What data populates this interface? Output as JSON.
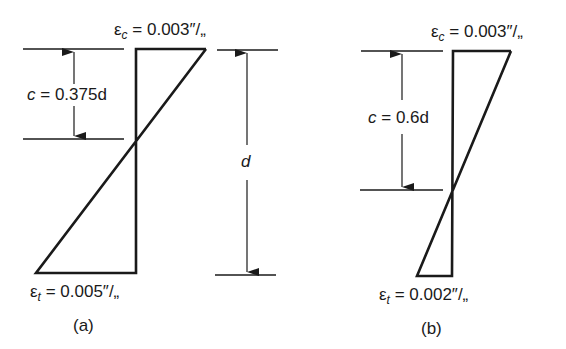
{
  "diagrams": [
    {
      "id": "a",
      "caption": "(a)",
      "top_strain": {
        "symbol": "ε",
        "sub": "c",
        "value": "= 0.003″/„"
      },
      "bottom_strain": {
        "symbol": "ε",
        "sub": "t",
        "value": "= 0.005″/„"
      },
      "neutral_axis": {
        "var": "c",
        "value": "= 0.375d"
      },
      "depth_label": "d"
    },
    {
      "id": "b",
      "caption": "(b)",
      "top_strain": {
        "symbol": "ε",
        "sub": "c",
        "value": "= 0.003″/„"
      },
      "bottom_strain": {
        "symbol": "ε",
        "sub": "t",
        "value": "= 0.002″/„"
      },
      "neutral_axis": {
        "var": "c",
        "value": "= 0.6d"
      }
    }
  ],
  "colors": {
    "line": "#1a1a1a",
    "background": "#ffffff"
  }
}
